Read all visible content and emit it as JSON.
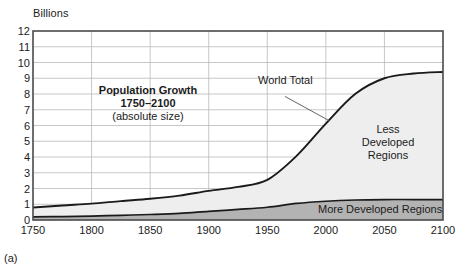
{
  "figure": {
    "panel_letter": "(a)",
    "y_axis_unit": "Billions",
    "title_line1": "Population Growth",
    "title_line2": "1750–2100",
    "title_line3": "(absolute size)",
    "label_world_total": "World Total",
    "label_less_developed": "Less Developed Regions",
    "label_less_developed_l1": "Less",
    "label_less_developed_l2": "Developed",
    "label_less_developed_l3": "Regions",
    "label_more_developed": "More Developed Regions"
  },
  "colors": {
    "less_developed_fill": "#eeeeee",
    "more_developed_fill": "#b3b3b3",
    "curve_stroke": "#1a1a1a",
    "grid": "#b9b9b9",
    "axis": "#4a4a4a",
    "text": "#1b1b1b",
    "background": "#ffffff"
  },
  "chart_data": {
    "type": "area",
    "title": "Population Growth 1750–2100 (absolute size)",
    "subtitle": "(absolute size)",
    "xlabel": "",
    "ylabel": "Billions",
    "xlim": [
      1750,
      2100
    ],
    "ylim": [
      0,
      12
    ],
    "grid": true,
    "legend_position": "in-plot annotations",
    "xticks": [
      1750,
      1800,
      1850,
      1900,
      1950,
      2000,
      2050,
      2100
    ],
    "yticks": [
      0,
      1,
      2,
      3,
      4,
      5,
      6,
      7,
      8,
      9,
      10,
      11,
      12
    ],
    "x": [
      1750,
      1775,
      1800,
      1825,
      1850,
      1875,
      1900,
      1925,
      1950,
      1975,
      2000,
      2025,
      2050,
      2075,
      2100
    ],
    "series": [
      {
        "name": "World Total",
        "stacked": false,
        "values": [
          0.79,
          0.92,
          1.04,
          1.2,
          1.35,
          1.55,
          1.85,
          2.1,
          2.55,
          4.07,
          6.12,
          8.0,
          9.0,
          9.3,
          9.4
        ]
      },
      {
        "name": "More Developed Regions",
        "stacked": false,
        "values": [
          0.2,
          0.22,
          0.25,
          0.3,
          0.35,
          0.42,
          0.55,
          0.67,
          0.81,
          1.05,
          1.19,
          1.27,
          1.3,
          1.3,
          1.3
        ]
      },
      {
        "name": "Less Developed Regions",
        "stacked": false,
        "note": "area between World Total and More Developed Regions",
        "values": [
          0.59,
          0.7,
          0.79,
          0.9,
          1.0,
          1.13,
          1.3,
          1.43,
          1.74,
          3.02,
          4.93,
          6.73,
          7.7,
          8.0,
          8.1
        ]
      }
    ],
    "annotations": [
      {
        "text": "World Total",
        "x": 1965,
        "y": 8.1,
        "leader_to": {
          "x": 2003,
          "y": 6.3
        }
      },
      {
        "text": "Less Developed Regions",
        "x": 2052,
        "y": 5.4
      },
      {
        "text": "More Developed Regions",
        "x": 2047,
        "y": 0.7
      }
    ]
  }
}
